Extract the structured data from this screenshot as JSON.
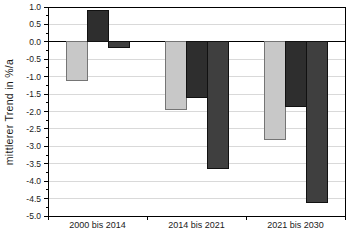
{
  "chart_data": {
    "type": "bar",
    "title": "",
    "xlabel": "",
    "ylabel": "mittlerer Trend in %/a",
    "ylim": [
      -5.0,
      1.0
    ],
    "ytick_step": 0.5,
    "minor_tick_step": 0.25,
    "grid": true,
    "legend_position": "none",
    "background_color": "#ffffff",
    "frame_color": "#000000",
    "gridline_color": "#d9d9d9",
    "zero_line_color": "#000000",
    "categories": [
      "2000 bis 2014",
      "2014 bis 2021",
      "2021 bis 2030"
    ],
    "ytick_labels": [
      "1.0",
      "0.5",
      "0.0",
      "-0.5",
      "-1.0",
      "-1.5",
      "-2.0",
      "-2.5",
      "-3.0",
      "-3.5",
      "-4.0",
      "-4.5",
      "-5.0"
    ],
    "series": [
      {
        "name": "series-1",
        "color": "#c8c8c8",
        "border": "#757575",
        "values": [
          -1.1,
          -1.95,
          -2.8
        ]
      },
      {
        "name": "series-2",
        "color": "#2e2e2e",
        "border": "#111111",
        "values": [
          0.9,
          -1.6,
          -1.85
        ]
      },
      {
        "name": "series-3",
        "color": "#3f3f3f",
        "border": "#111111",
        "values": [
          -0.15,
          -3.65,
          -4.6
        ]
      }
    ]
  }
}
